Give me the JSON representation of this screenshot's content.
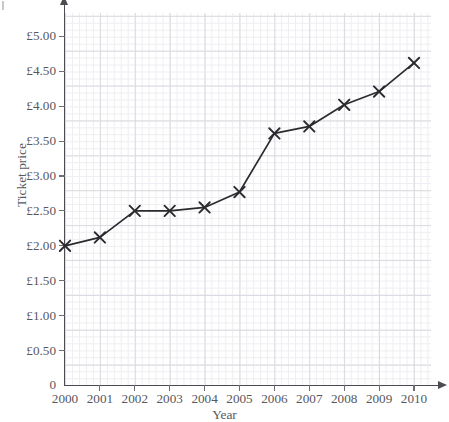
{
  "chart_data": {
    "type": "line",
    "title": "",
    "subtitle": "",
    "xlabel": "Year",
    "ylabel": "Ticket price",
    "grid": true,
    "legend": false,
    "legend_position": "none",
    "marker": "x",
    "line_color": "#2b2b2f",
    "grid_color_major": "#dadae0",
    "grid_color_minor": "#eeeef2",
    "axis_color": "#4c4c52",
    "text_color": "#58585e",
    "xlim": [
      2000,
      2010
    ],
    "ylim": [
      0,
      5.35
    ],
    "x": [
      2000,
      2001,
      2002,
      2003,
      2004,
      2005,
      2006,
      2007,
      2008,
      2009,
      2010
    ],
    "categories": [
      "2000",
      "2001",
      "2002",
      "2003",
      "2004",
      "2005",
      "2006",
      "2007",
      "2008",
      "2009",
      "2010"
    ],
    "values": [
      2.0,
      2.12,
      2.5,
      2.5,
      2.55,
      2.77,
      3.61,
      3.71,
      4.02,
      4.21,
      4.62
    ],
    "y_tick_values": [
      0,
      0.5,
      1.0,
      1.5,
      2.0,
      2.5,
      3.0,
      3.5,
      4.0,
      4.5,
      5.0
    ],
    "y_tick_labels": [
      "0",
      "£0.50",
      "£1.00",
      "£1.50",
      "£2.00",
      "£2.50",
      "£3.00",
      "£3.50",
      "£4.00",
      "£4.50",
      "£5.00"
    ],
    "x_tick_labels": [
      "2000",
      "2001",
      "2002",
      "2003",
      "2004",
      "2005",
      "2006",
      "2007",
      "2008",
      "2009",
      "2010"
    ],
    "annotations": []
  }
}
